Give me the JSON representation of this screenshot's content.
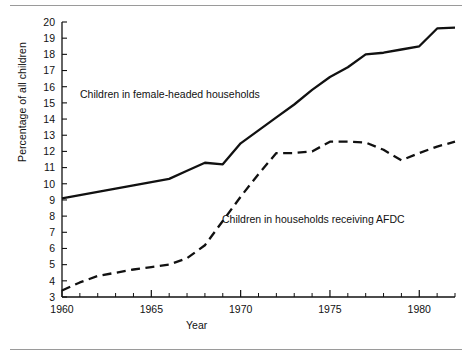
{
  "chart_data": {
    "type": "line",
    "title": "",
    "subtitle": "",
    "xlabel": "Year",
    "ylabel": "Percentage of all children",
    "xlim": [
      1960,
      1982
    ],
    "ylim": [
      3,
      20
    ],
    "grid": false,
    "legend_position": "inline-annotations",
    "x_tick_labels": [
      "1960",
      "1965",
      "1970",
      "1975",
      "1980"
    ],
    "x_tick_values": [
      1960,
      1965,
      1970,
      1975,
      1980
    ],
    "x_minor_tick_values": [
      1961,
      1962,
      1963,
      1964,
      1966,
      1967,
      1968,
      1969,
      1971,
      1972,
      1973,
      1974,
      1976,
      1977,
      1978,
      1979,
      1981,
      1982
    ],
    "y_tick_labels": [
      "3",
      "4",
      "5",
      "6",
      "7",
      "8",
      "9",
      "10",
      "11",
      "12",
      "13",
      "14",
      "15",
      "16",
      "17",
      "18",
      "19",
      "20"
    ],
    "y_tick_values": [
      3,
      4,
      5,
      6,
      7,
      8,
      9,
      10,
      11,
      12,
      13,
      14,
      15,
      16,
      17,
      18,
      19,
      20
    ],
    "x": [
      1960,
      1961,
      1962,
      1963,
      1964,
      1965,
      1966,
      1967,
      1968,
      1969,
      1970,
      1971,
      1972,
      1973,
      1974,
      1975,
      1976,
      1977,
      1978,
      1979,
      1980,
      1981,
      1982
    ],
    "series": [
      {
        "name": "Children in female-headed households",
        "style": "solid",
        "color": "#111111",
        "values": [
          9.1,
          9.3,
          9.5,
          9.7,
          9.9,
          10.1,
          10.3,
          10.8,
          11.3,
          11.2,
          12.5,
          13.3,
          14.1,
          14.9,
          15.8,
          16.6,
          17.2,
          18.0,
          18.1,
          18.3,
          18.5,
          19.6,
          19.65
        ]
      },
      {
        "name": "Children in households receiving AFDC",
        "style": "dashed",
        "color": "#111111",
        "values": [
          3.4,
          3.9,
          4.3,
          4.5,
          4.7,
          4.85,
          5.0,
          5.4,
          6.2,
          7.7,
          9.2,
          10.6,
          11.9,
          11.9,
          12.0,
          12.6,
          12.6,
          12.55,
          12.1,
          11.45,
          11.9,
          12.3,
          12.6
        ]
      }
    ],
    "annotations": [
      {
        "text": "Children in female-headed households",
        "x": 1962.4,
        "y": 16.1
      },
      {
        "text": "Children in households receiving AFDC",
        "x": 1969.5,
        "y": 8.1
      }
    ]
  },
  "axes": {
    "y_title": "Percentage of all children",
    "x_title": "Year"
  },
  "labels": {
    "female_headed": "Children in female-headed households",
    "afdc": "Children in households receiving AFDC"
  }
}
